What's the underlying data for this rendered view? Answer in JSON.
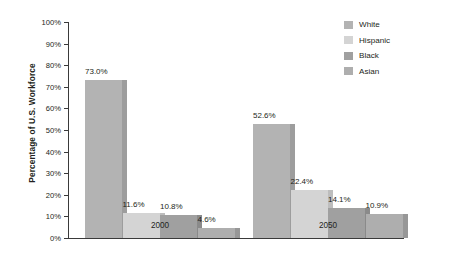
{
  "chart_data": {
    "type": "bar",
    "title": "",
    "subtitle": "",
    "xlabel": "",
    "ylabel": "Percentage of U.S. Workforce",
    "categories": [
      "2000",
      "2050"
    ],
    "ylim": [
      0,
      100
    ],
    "ytick_labels": [
      "0%",
      "10%",
      "20%",
      "30%",
      "40%",
      "50%",
      "60%",
      "70%",
      "80%",
      "90%",
      "100%"
    ],
    "ytick_values": [
      0,
      10,
      20,
      30,
      40,
      50,
      60,
      70,
      80,
      90,
      100
    ],
    "grid": false,
    "legend_position": "top-right",
    "series": [
      {
        "name": "White",
        "color": "#b3b3b3",
        "side_color": "#9d9d9d",
        "values": [
          73.0,
          52.6
        ],
        "labels": [
          "73.0%",
          "52.6%"
        ]
      },
      {
        "name": "Hispanic",
        "color": "#d4d4d4",
        "side_color": "#bdbdbd",
        "values": [
          11.6,
          22.4
        ],
        "labels": [
          "11.6%",
          "22.4%"
        ]
      },
      {
        "name": "Black",
        "color": "#a0a0a0",
        "side_color": "#8a8a8a",
        "values": [
          10.8,
          14.1
        ],
        "labels": [
          "10.8%",
          "14.1%"
        ]
      },
      {
        "name": "Asian",
        "color": "#aeaeae",
        "side_color": "#979797",
        "values": [
          4.6,
          10.9
        ],
        "labels": [
          "4.6%",
          "10.9%"
        ]
      }
    ]
  },
  "legend": {
    "items": [
      {
        "label": "White"
      },
      {
        "label": "Hispanic"
      },
      {
        "label": "Black"
      },
      {
        "label": "Asian"
      }
    ]
  },
  "axis": {
    "y_title": "Percentage of U.S. Workforce",
    "x_categories": [
      {
        "label": "2000"
      },
      {
        "label": "2050"
      }
    ]
  },
  "colors": {
    "axis": "#3a3a3a",
    "text": "#231f20",
    "background": "#ffffff"
  }
}
